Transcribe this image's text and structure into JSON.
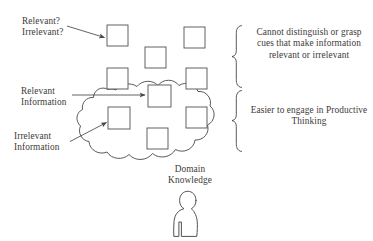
{
  "diagram": {
    "background_color": "#ffffff",
    "stroke_color": "#4a4745",
    "text_color": "#3d3a38",
    "labels": {
      "relevant_question": "Relevant?\nIrrelevant?",
      "relevant_information": "Relevant\nInformation",
      "irrelevant_information": "Irrelevant\nInformation",
      "domain_knowledge": "Domain\nKnowledge",
      "cannot_distinguish": "Cannot distinguish or grasp cues that make information relevant or irrelevant",
      "easier_engage": "Easier to engage in Productive Thinking"
    },
    "shapes": {
      "cloud_name": "domain-knowledge-cloud",
      "person_name": "person-figure",
      "brace_top_name": "brace-upper",
      "brace_bottom_name": "brace-lower"
    },
    "boxes": [
      {
        "name": "box-outside-top-left",
        "x": 107,
        "y": 25,
        "w": 21,
        "h": 21,
        "inside_cloud": false
      },
      {
        "name": "box-outside-top-right",
        "x": 184,
        "y": 27,
        "w": 21,
        "h": 21,
        "inside_cloud": false
      },
      {
        "name": "box-outside-top-middle",
        "x": 145,
        "y": 47,
        "w": 21,
        "h": 21,
        "inside_cloud": false
      },
      {
        "name": "box-edge-left",
        "x": 107,
        "y": 68,
        "w": 21,
        "h": 21,
        "inside_cloud": false
      },
      {
        "name": "box-edge-right",
        "x": 186,
        "y": 68,
        "w": 21,
        "h": 21,
        "inside_cloud": false
      },
      {
        "name": "box-inside-center-top",
        "x": 148,
        "y": 85,
        "w": 23,
        "h": 22,
        "inside_cloud": true
      },
      {
        "name": "box-inside-left",
        "x": 108,
        "y": 107,
        "w": 22,
        "h": 22,
        "inside_cloud": true
      },
      {
        "name": "box-inside-right",
        "x": 186,
        "y": 107,
        "w": 21,
        "h": 21,
        "inside_cloud": true
      },
      {
        "name": "box-inside-center-low",
        "x": 147,
        "y": 128,
        "w": 21,
        "h": 21,
        "inside_cloud": true
      }
    ],
    "arrows": [
      {
        "name": "arrow-relevant-question",
        "x1": 67,
        "y1": 26,
        "x2": 105,
        "y2": 38
      },
      {
        "name": "arrow-relevant-information",
        "x1": 72,
        "y1": 95,
        "x2": 146,
        "y2": 95
      },
      {
        "name": "arrow-irrelevant-information",
        "x1": 70,
        "y1": 141,
        "x2": 107,
        "y2": 122
      }
    ]
  }
}
